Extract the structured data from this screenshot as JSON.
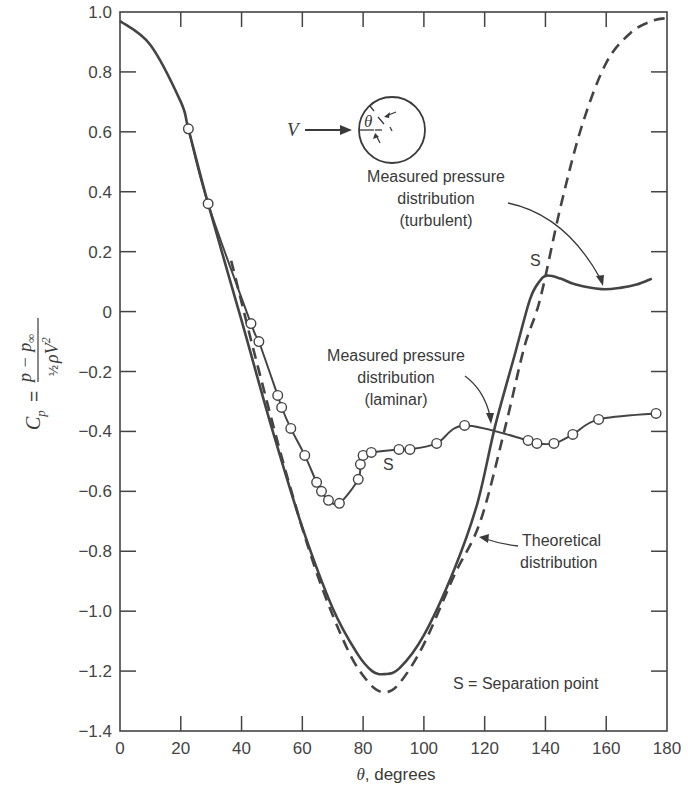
{
  "chart_data": {
    "type": "line",
    "title": "",
    "xlabel": "θ, degrees",
    "xlabel_symbol": "θ",
    "xlabel_rest": ", degrees",
    "ylabel": "C_p = (p − p∞) / (½ρV²)",
    "ylabel_parts": {
      "lhs": "C",
      "lhs_sub": "p",
      "num": "p − p",
      "num_sub": "∞",
      "den_frac": "½",
      "den": "ρV",
      "den_sup": "2"
    },
    "xlim": [
      0,
      180
    ],
    "ylim": [
      -1.4,
      1.0
    ],
    "grid": false,
    "x_ticks": [
      0,
      20,
      40,
      60,
      80,
      100,
      120,
      140,
      160,
      180
    ],
    "x_tick_labels": [
      "0",
      "20",
      "40",
      "60",
      "80",
      "100",
      "120",
      "140",
      "160",
      "180"
    ],
    "y_ticks": [
      1.0,
      0.8,
      0.6,
      0.4,
      0.2,
      0,
      -0.2,
      -0.4,
      -0.6,
      -0.8,
      -1.0,
      -1.2,
      -1.4
    ],
    "y_tick_labels": [
      "1.0",
      "0.8",
      "0.6",
      "0.4",
      "0.2",
      "0",
      "-0.2",
      "-0.4",
      "-0.6",
      "-0.8",
      "-1.0",
      "-1.2",
      "-1.4"
    ],
    "series": [
      {
        "name": "Theoretical distribution",
        "style": "dashed",
        "x": [
          36.6,
          45,
          55,
          65,
          75,
          82,
          87,
          92,
          100,
          110,
          118.6,
          126.8,
          133,
          138.2,
          145,
          152,
          160,
          168,
          175,
          180
        ],
        "y": [
          0.17,
          -0.17,
          -0.55,
          -0.88,
          -1.13,
          -1.24,
          -1.27,
          -1.24,
          -1.11,
          -0.88,
          -0.7,
          -0.385,
          -0.12,
          0.04,
          0.35,
          0.62,
          0.83,
          0.93,
          0.97,
          0.98
        ]
      },
      {
        "name": "Measured pressure distribution (turbulent)",
        "style": "solid",
        "x": [
          0,
          10,
          20,
          22.5,
          29,
          40,
          50,
          60,
          70,
          78,
          83,
          87,
          92,
          100,
          110,
          117.6,
          123.5,
          130,
          134.9,
          138,
          140.5,
          145,
          150,
          158.5,
          165,
          170,
          175
        ],
        "y": [
          0.97,
          0.89,
          0.7,
          0.61,
          0.36,
          -0.03,
          -0.39,
          -0.72,
          -0.99,
          -1.14,
          -1.2,
          -1.21,
          -1.19,
          -1.08,
          -0.86,
          -0.64,
          -0.38,
          -0.14,
          0.04,
          0.1,
          0.12,
          0.11,
          0.09,
          0.075,
          0.08,
          0.09,
          0.11
        ]
      },
      {
        "name": "Measured pressure distribution (laminar)",
        "style": "solid-markers",
        "x": [
          22.5,
          29,
          43.1,
          45.7,
          51.9,
          53.2,
          56.2,
          60.8,
          64.7,
          66.3,
          68.6,
          72.2,
          78.4,
          79.1,
          80.0,
          82.7,
          91.8,
          95.4,
          104.2,
          113.4,
          134.3,
          137.2,
          142.8,
          149,
          157.5,
          176.4
        ],
        "y": [
          0.61,
          0.36,
          -0.04,
          -0.1,
          -0.28,
          -0.32,
          -0.39,
          -0.48,
          -0.57,
          -0.6,
          -0.63,
          -0.64,
          -0.56,
          -0.51,
          -0.48,
          -0.47,
          -0.46,
          -0.46,
          -0.44,
          -0.38,
          -0.43,
          -0.44,
          -0.44,
          -0.41,
          -0.36,
          -0.34
        ]
      }
    ],
    "annotations": [
      {
        "text": "S",
        "meaning": "laminar separation point",
        "x": 84.5,
        "y": -0.55
      },
      {
        "text": "S",
        "meaning": "turbulent separation point",
        "x": 137.5,
        "y": 0.24
      },
      {
        "text": "S = Separation point",
        "x": 118,
        "y": -1.35
      }
    ],
    "legend": "inline labels with arrows"
  },
  "labels": {
    "turbulent": [
      "Measured pressure",
      "distribution",
      "(turbulent)"
    ],
    "laminar": [
      "Measured pressure",
      "distribution",
      "(laminar)"
    ],
    "theoretical": [
      "Theoretical",
      "distribution"
    ],
    "separation_key": "S = Separation point",
    "sep_mark": "S"
  },
  "inset": {
    "velocity_label": "V",
    "angle_label": "θ"
  }
}
